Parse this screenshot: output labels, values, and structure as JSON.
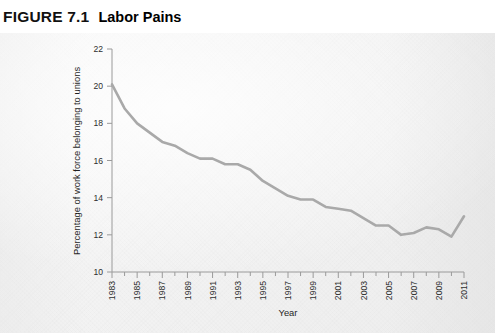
{
  "figure": {
    "number": "FIGURE 7.1",
    "title": "Labor Pains"
  },
  "colors": {
    "line": "#a9a9a9",
    "axis": "#9a9a9a",
    "text": "#2e2e2e",
    "panel_background": "#f2f2f2"
  },
  "chart_data": {
    "type": "line",
    "title": "Labor Pains",
    "xlabel": "Year",
    "ylabel": "Percentage of work force belonging to unions",
    "xlim": [
      1983,
      2011
    ],
    "ylim": [
      10,
      22
    ],
    "ytick_labels": [
      "10",
      "12",
      "14",
      "16",
      "18",
      "20",
      "22"
    ],
    "yticks": [
      10,
      12,
      14,
      16,
      18,
      20,
      22
    ],
    "xtick_labels": [
      "1983",
      "1985",
      "1987",
      "1989",
      "1991",
      "1993",
      "1995",
      "1997",
      "1999",
      "2001",
      "2003",
      "2005",
      "2007",
      "2009",
      "2011"
    ],
    "xticks_labeled": [
      1983,
      1985,
      1987,
      1989,
      1991,
      1993,
      1995,
      1997,
      1999,
      2001,
      2003,
      2005,
      2007,
      2009,
      2011
    ],
    "xticks_minor_every": 1,
    "grid": false,
    "legend": null,
    "x": [
      1983,
      1984,
      1985,
      1986,
      1987,
      1988,
      1989,
      1990,
      1991,
      1992,
      1993,
      1994,
      1995,
      1996,
      1997,
      1998,
      1999,
      2000,
      2001,
      2002,
      2003,
      2004,
      2005,
      2006,
      2007,
      2008,
      2009,
      2010,
      2011
    ],
    "values": [
      20.1,
      18.8,
      18.0,
      17.5,
      17.0,
      16.8,
      16.4,
      16.1,
      16.1,
      15.8,
      15.8,
      15.5,
      14.9,
      14.5,
      14.1,
      13.9,
      13.9,
      13.5,
      13.4,
      13.3,
      12.9,
      12.5,
      12.5,
      12.0,
      12.1,
      12.4,
      12.3,
      11.9,
      13.0
    ],
    "series": [
      {
        "name": "Percentage of work force belonging to unions",
        "values": [
          20.1,
          18.8,
          18.0,
          17.5,
          17.0,
          16.8,
          16.4,
          16.1,
          16.1,
          15.8,
          15.8,
          15.5,
          14.9,
          14.5,
          14.1,
          13.9,
          13.9,
          13.5,
          13.4,
          13.3,
          12.9,
          12.5,
          12.5,
          12.0,
          12.1,
          12.4,
          12.3,
          11.9,
          13.0
        ],
        "color": "#a9a9a9"
      }
    ]
  }
}
